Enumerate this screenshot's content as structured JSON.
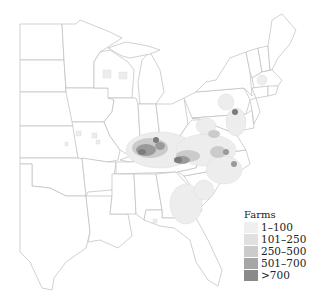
{
  "map": {
    "subject": "Eastern United States counties, farm counts",
    "legend": {
      "title": "Farms",
      "classes": [
        {
          "label": "1–100",
          "color": "#efefef"
        },
        {
          "label": "101–250",
          "color": "#e0e0e0"
        },
        {
          "label": "250–500",
          "color": "#cbcbcb"
        },
        {
          "label": "501–700",
          "color": "#a6a6a6"
        },
        {
          "label": ">700",
          "color": "#8a8a8a"
        }
      ]
    },
    "hotspots": [
      {
        "region": "Kentucky / Tennessee",
        "class": ">700"
      },
      {
        "region": "Western North Carolina / Virginia",
        "class": "501–700"
      },
      {
        "region": "Southeastern Pennsylvania",
        "class": ">700"
      },
      {
        "region": "Georgia / South Carolina",
        "class": "101–250"
      },
      {
        "region": "Wisconsin",
        "class": "1–100"
      },
      {
        "region": "Missouri",
        "class": "1–100"
      }
    ]
  }
}
